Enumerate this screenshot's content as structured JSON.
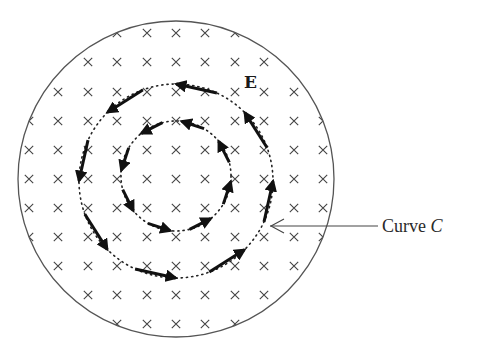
{
  "figure": {
    "labels": {
      "field_label": "E",
      "curve_label_text": "Curve ",
      "curve_label_var": "C"
    },
    "colors": {
      "ink": "#1a1a1a",
      "cross": "#444444",
      "boundary": "#555555",
      "background": "#ffffff"
    },
    "region": {
      "cx": 176,
      "cy": 179,
      "r": 158
    },
    "field_marker": "cross-into-page",
    "grid": {
      "xs": [
        29,
        58,
        88,
        117,
        147,
        176,
        205,
        235,
        264,
        294,
        323
      ],
      "ys": [
        33,
        62,
        92,
        121,
        150,
        179,
        208,
        237,
        266,
        295,
        324
      ]
    },
    "curves": [
      {
        "name": "outer-curve-C",
        "cx": 176,
        "cy": 181,
        "r": 97,
        "arrows": 8
      },
      {
        "name": "inner-curve",
        "cx": 176,
        "cy": 176,
        "r": 55,
        "arrows": 8
      }
    ],
    "circulation": "counterclockwise"
  }
}
